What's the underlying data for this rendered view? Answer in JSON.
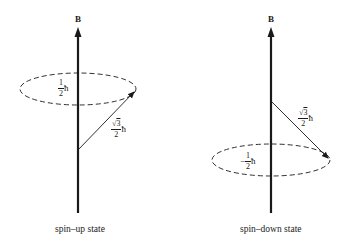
{
  "diagrams": [
    {
      "id": "spin-up",
      "field_label": "B",
      "z_component": {
        "sign": "",
        "numerator": "1",
        "denominator": "2",
        "unit": "ħ"
      },
      "magnitude": {
        "numerator_sqrt": "3",
        "denominator": "2",
        "unit": "ħ"
      },
      "caption": "spin–up state"
    },
    {
      "id": "spin-down",
      "field_label": "B",
      "z_component": {
        "sign": "−",
        "numerator": "1",
        "denominator": "2",
        "unit": "ħ"
      },
      "magnitude": {
        "numerator_sqrt": "3",
        "denominator": "2",
        "unit": "ħ"
      },
      "caption": "spin–down state"
    }
  ],
  "colors": {
    "stroke": "#1a1a1a",
    "background": "#ffffff"
  }
}
